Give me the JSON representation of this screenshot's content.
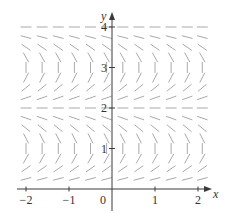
{
  "figure": {
    "type": "slope-field",
    "colors": {
      "axis": "#3a3a3a",
      "segment": "#a9a9a9",
      "text": "#333333",
      "background": "#ffffff"
    },
    "x_axis": {
      "label": "x",
      "ticks": [
        {
          "value": -2,
          "label": "−2"
        },
        {
          "value": -1,
          "label": "−1"
        },
        {
          "value": 1,
          "label": "1"
        },
        {
          "value": 2,
          "label": "2"
        }
      ],
      "origin_label": "0",
      "range": [
        -2.2,
        2.3
      ]
    },
    "y_axis": {
      "label": "y",
      "ticks": [
        {
          "value": 1,
          "label": "1"
        },
        {
          "value": 2,
          "label": "2"
        },
        {
          "value": 3,
          "label": "3"
        },
        {
          "value": 4,
          "label": "4"
        }
      ],
      "range": [
        0,
        4.2
      ]
    },
    "field": {
      "x_columns": [
        -2.0,
        -1.625,
        -1.25,
        -0.875,
        -0.5,
        -0.125,
        0.25,
        0.625,
        1.0,
        1.375,
        1.75,
        2.1
      ],
      "y_step": 0.25,
      "y_min": 0.25,
      "y_max": 4.0,
      "equilibria_horizontal": [
        0,
        2,
        4
      ],
      "vertical_slopes_near": [
        1,
        3
      ],
      "description": "Slope independent of x; horizontal segments at y=0,2,4; near-vertical at y=1,3"
    }
  }
}
